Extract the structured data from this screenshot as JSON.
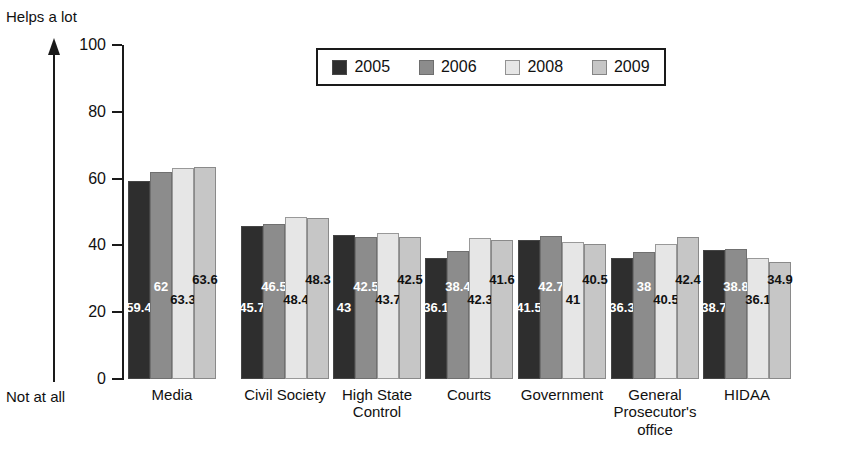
{
  "chart_data": {
    "type": "bar",
    "title": "",
    "xlabel": "",
    "ylabel": "",
    "ylim": [
      0,
      100
    ],
    "yticks": [
      0,
      20,
      40,
      60,
      80,
      100
    ],
    "grid": false,
    "legend_position": "top-center",
    "axis_top_annotation": "Helps a lot",
    "axis_bottom_annotation": "Not at all",
    "categories": [
      "Media",
      "Civil Society",
      "High State Control",
      "Courts",
      "Government",
      "General Prosecutor's office",
      "HIDAA"
    ],
    "category_lines": [
      [
        "Media"
      ],
      [
        "Civil Society"
      ],
      [
        "High State",
        "Control"
      ],
      [
        "Courts"
      ],
      [
        "Government"
      ],
      [
        "General",
        "Prosecutor's",
        "office"
      ],
      [
        "HIDAA"
      ]
    ],
    "series": [
      {
        "name": "2005",
        "color": "#2e2e2e",
        "label_color": "#ffffff",
        "values": [
          59.4,
          45.7,
          43,
          36.1,
          41.5,
          36.3,
          38.7
        ]
      },
      {
        "name": "2006",
        "color": "#8c8c8c",
        "label_color": "#ffffff",
        "values": [
          62,
          46.5,
          42.5,
          38.4,
          42.7,
          38,
          38.8
        ]
      },
      {
        "name": "2008",
        "color": "#e6e6e6",
        "label_color": "#111111",
        "values": [
          63.3,
          48.4,
          43.7,
          42.3,
          41,
          40.5,
          36.1
        ]
      },
      {
        "name": "2009",
        "color": "#c6c6c6",
        "label_color": "#111111",
        "values": [
          63.6,
          48.3,
          42.5,
          41.6,
          40.5,
          42.4,
          34.9
        ]
      }
    ]
  }
}
